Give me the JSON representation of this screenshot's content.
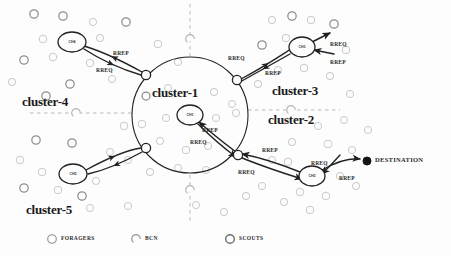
{
  "figure": {
    "title_text_visible": false,
    "background_color": "#fdfdfd",
    "ink_color": "#222222",
    "node_gray": "#8e8e8e",
    "node_light_gray": "#c9c9c9"
  },
  "cluster_labels": [
    {
      "id": "cluster-1",
      "text": "cluster-1",
      "x": 152,
      "y": 86
    },
    {
      "id": "cluster-2",
      "text": "cluster-2",
      "x": 268,
      "y": 113
    },
    {
      "id": "cluster-3",
      "text": "cluster-3",
      "x": 272,
      "y": 84
    },
    {
      "id": "cluster-4",
      "text": "cluster-4",
      "x": 22,
      "y": 95
    },
    {
      "id": "cluster-5",
      "text": "cluster-5",
      "x": 26,
      "y": 203
    }
  ],
  "cluster_heads": [
    {
      "id": "ch4",
      "label": "CH4",
      "cx": 72,
      "cy": 42,
      "rx": 14,
      "ry": 10
    },
    {
      "id": "ch3",
      "label": "CH3",
      "cx": 302,
      "cy": 47,
      "rx": 13,
      "ry": 10
    },
    {
      "id": "ch1",
      "label": "CH1",
      "cx": 190,
      "cy": 115,
      "rx": 13,
      "ry": 10
    },
    {
      "id": "ch5",
      "label": "CH5",
      "cx": 73,
      "cy": 174,
      "rx": 14,
      "ry": 10
    },
    {
      "id": "ch2",
      "label": "CH2",
      "cx": 312,
      "cy": 176,
      "rx": 13,
      "ry": 10
    }
  ],
  "gateway_nodes": [
    {
      "id": "gw-northwest",
      "cx": 146,
      "cy": 75
    },
    {
      "id": "gw-northeast",
      "cx": 237,
      "cy": 80
    },
    {
      "id": "gw-southeast",
      "cx": 238,
      "cy": 155
    },
    {
      "id": "gw-southwest",
      "cx": 146,
      "cy": 148
    }
  ],
  "destination": {
    "id": "destination",
    "label": "DESTINATION",
    "cx": 367,
    "cy": 161,
    "r": 4,
    "label_x": 375,
    "label_y": 157
  },
  "packet_labels": [
    {
      "id": "p1",
      "text": "RREP",
      "x": 113,
      "y": 51
    },
    {
      "id": "p2",
      "text": "RREQ",
      "x": 96,
      "y": 68
    },
    {
      "id": "p3",
      "text": "RREQ",
      "x": 228,
      "y": 56
    },
    {
      "id": "p4",
      "text": "RREP",
      "x": 265,
      "y": 71
    },
    {
      "id": "p5",
      "text": "RREQ",
      "x": 330,
      "y": 42
    },
    {
      "id": "p6",
      "text": "RREP",
      "x": 330,
      "y": 60
    },
    {
      "id": "p7",
      "text": "RREP",
      "x": 202,
      "y": 128
    },
    {
      "id": "p8",
      "text": "RREQ",
      "x": 190,
      "y": 140
    },
    {
      "id": "p9",
      "text": "RREP",
      "x": 262,
      "y": 148
    },
    {
      "id": "p10",
      "text": "RREQ",
      "x": 238,
      "y": 170
    },
    {
      "id": "p11",
      "text": "RREQ",
      "x": 311,
      "y": 161
    },
    {
      "id": "p12",
      "text": "RREP",
      "x": 339,
      "y": 176
    }
  ],
  "legend": {
    "items": [
      {
        "id": "legend-foragers",
        "text": "FORAGERS",
        "marker": "open-circle",
        "cx": 52,
        "cy": 239,
        "text_x": 61,
        "text_y": 236
      },
      {
        "id": "legend-bcn",
        "text": "BCN",
        "marker": "dashed-circle",
        "cx": 136,
        "cy": 239,
        "text_x": 145,
        "text_y": 236
      },
      {
        "id": "legend-scouts",
        "text": "SCOUTS",
        "marker": "bold-circle",
        "cx": 230,
        "cy": 239,
        "text_x": 239,
        "text_y": 236
      }
    ]
  },
  "big_circle": {
    "cx": 190,
    "cy": 115,
    "r": 58
  },
  "divider_lines": [
    {
      "id": "divider-top",
      "x1": 190,
      "y1": 4,
      "x2": 190,
      "y2": 56
    },
    {
      "id": "divider-bottom",
      "x1": 190,
      "y1": 175,
      "x2": 190,
      "y2": 222
    },
    {
      "id": "divider-left",
      "x1": 30,
      "y1": 113,
      "x2": 132,
      "y2": 113
    },
    {
      "id": "divider-right",
      "x1": 248,
      "y1": 110,
      "x2": 340,
      "y2": 110
    }
  ],
  "bcn_on_dividers": [
    {
      "id": "bcn-top",
      "cx": 190,
      "cy": 39
    },
    {
      "id": "bcn-bottom",
      "cx": 190,
      "cy": 190
    },
    {
      "id": "bcn-left",
      "cx": 76,
      "cy": 113
    },
    {
      "id": "bcn-right",
      "cx": 291,
      "cy": 110
    }
  ],
  "scatter_nodes": [
    {
      "cx": 34,
      "cy": 14,
      "r": 4.2,
      "tone": "mid"
    },
    {
      "cx": 63,
      "cy": 16,
      "r": 4.2,
      "tone": "mid"
    },
    {
      "cx": 93,
      "cy": 22,
      "r": 3.6,
      "tone": "light"
    },
    {
      "cx": 126,
      "cy": 22,
      "r": 4.2,
      "tone": "mid"
    },
    {
      "cx": 43,
      "cy": 39,
      "r": 3.8,
      "tone": "light"
    },
    {
      "cx": 100,
      "cy": 38,
      "r": 3.6,
      "tone": "light"
    },
    {
      "cx": 24,
      "cy": 60,
      "r": 4.2,
      "tone": "mid"
    },
    {
      "cx": 53,
      "cy": 57,
      "r": 3.8,
      "tone": "light"
    },
    {
      "cx": 90,
      "cy": 63,
      "r": 3.8,
      "tone": "light"
    },
    {
      "cx": 70,
      "cy": 84,
      "r": 4.2,
      "tone": "mid"
    },
    {
      "cx": 46,
      "cy": 96,
      "r": 4.2,
      "tone": "mid"
    },
    {
      "cx": 112,
      "cy": 79,
      "r": 3.6,
      "tone": "light"
    },
    {
      "cx": 12,
      "cy": 82,
      "r": 3.6,
      "tone": "light"
    },
    {
      "cx": 36,
      "cy": 140,
      "r": 4.2,
      "tone": "mid"
    },
    {
      "cx": 72,
      "cy": 143,
      "r": 4.2,
      "tone": "mid"
    },
    {
      "cx": 20,
      "cy": 160,
      "r": 3.8,
      "tone": "light"
    },
    {
      "cx": 42,
      "cy": 172,
      "r": 3.8,
      "tone": "light"
    },
    {
      "cx": 24,
      "cy": 188,
      "r": 4.2,
      "tone": "mid"
    },
    {
      "cx": 58,
      "cy": 190,
      "r": 3.8,
      "tone": "light"
    },
    {
      "cx": 82,
      "cy": 196,
      "r": 4.2,
      "tone": "mid"
    },
    {
      "cx": 96,
      "cy": 181,
      "r": 3.6,
      "tone": "light"
    },
    {
      "cx": 110,
      "cy": 152,
      "r": 3.6,
      "tone": "light"
    },
    {
      "cx": 128,
      "cy": 160,
      "r": 3.6,
      "tone": "light"
    },
    {
      "cx": 90,
      "cy": 208,
      "r": 3.6,
      "tone": "light"
    },
    {
      "cx": 158,
      "cy": 44,
      "r": 3.8,
      "tone": "light"
    },
    {
      "cx": 178,
      "cy": 62,
      "r": 3.6,
      "tone": "light"
    },
    {
      "cx": 146,
      "cy": 96,
      "r": 4.0,
      "tone": "mid"
    },
    {
      "cx": 168,
      "cy": 88,
      "r": 3.6,
      "tone": "light"
    },
    {
      "cx": 214,
      "cy": 92,
      "r": 3.6,
      "tone": "light"
    },
    {
      "cx": 232,
      "cy": 104,
      "r": 3.6,
      "tone": "light"
    },
    {
      "cx": 142,
      "cy": 124,
      "r": 3.8,
      "tone": "light"
    },
    {
      "cx": 166,
      "cy": 118,
      "r": 3.6,
      "tone": "light"
    },
    {
      "cx": 216,
      "cy": 118,
      "r": 3.6,
      "tone": "light"
    },
    {
      "cx": 236,
      "cy": 113,
      "r": 3.6,
      "tone": "light"
    },
    {
      "cx": 160,
      "cy": 141,
      "r": 3.6,
      "tone": "light"
    },
    {
      "cx": 186,
      "cy": 150,
      "r": 3.8,
      "tone": "light"
    },
    {
      "cx": 208,
      "cy": 146,
      "r": 3.6,
      "tone": "light"
    },
    {
      "cx": 178,
      "cy": 168,
      "r": 3.6,
      "tone": "light"
    },
    {
      "cx": 206,
      "cy": 170,
      "r": 3.6,
      "tone": "light"
    },
    {
      "cx": 150,
      "cy": 172,
      "r": 3.6,
      "tone": "light"
    },
    {
      "cx": 272,
      "cy": 20,
      "r": 3.6,
      "tone": "light"
    },
    {
      "cx": 292,
      "cy": 16,
      "r": 4.2,
      "tone": "mid"
    },
    {
      "cx": 311,
      "cy": 20,
      "r": 3.8,
      "tone": "light"
    },
    {
      "cx": 334,
      "cy": 24,
      "r": 4.2,
      "tone": "mid"
    },
    {
      "cx": 286,
      "cy": 38,
      "r": 3.8,
      "tone": "light"
    },
    {
      "cx": 262,
      "cy": 45,
      "r": 4.2,
      "tone": "mid"
    },
    {
      "cx": 346,
      "cy": 50,
      "r": 3.8,
      "tone": "light"
    },
    {
      "cx": 304,
      "cy": 68,
      "r": 3.8,
      "tone": "light"
    },
    {
      "cx": 278,
      "cy": 70,
      "r": 3.6,
      "tone": "light"
    },
    {
      "cx": 330,
      "cy": 76,
      "r": 3.6,
      "tone": "light"
    },
    {
      "cx": 258,
      "cy": 84,
      "r": 3.6,
      "tone": "light"
    },
    {
      "cx": 350,
      "cy": 94,
      "r": 3.6,
      "tone": "light"
    },
    {
      "cx": 318,
      "cy": 126,
      "r": 3.6,
      "tone": "light"
    },
    {
      "cx": 344,
      "cy": 120,
      "r": 3.6,
      "tone": "light"
    },
    {
      "cx": 292,
      "cy": 142,
      "r": 3.6,
      "tone": "light"
    },
    {
      "cx": 328,
      "cy": 144,
      "r": 3.8,
      "tone": "light"
    },
    {
      "cx": 352,
      "cy": 150,
      "r": 3.6,
      "tone": "light"
    },
    {
      "cx": 288,
      "cy": 162,
      "r": 3.8,
      "tone": "light"
    },
    {
      "cx": 300,
      "cy": 192,
      "r": 3.8,
      "tone": "light"
    },
    {
      "cx": 326,
      "cy": 196,
      "r": 3.8,
      "tone": "light"
    },
    {
      "cx": 284,
      "cy": 202,
      "r": 3.6,
      "tone": "light"
    },
    {
      "cx": 340,
      "cy": 176,
      "r": 3.6,
      "tone": "light"
    },
    {
      "cx": 262,
      "cy": 186,
      "r": 3.6,
      "tone": "light"
    },
    {
      "cx": 356,
      "cy": 186,
      "r": 3.6,
      "tone": "light"
    },
    {
      "cx": 310,
      "cy": 210,
      "r": 3.8,
      "tone": "light"
    },
    {
      "cx": 272,
      "cy": 160,
      "r": 3.6,
      "tone": "light"
    },
    {
      "cx": 246,
      "cy": 196,
      "r": 3.6,
      "tone": "light"
    },
    {
      "cx": 368,
      "cy": 130,
      "r": 3.6,
      "tone": "light"
    },
    {
      "cx": 224,
      "cy": 212,
      "r": 3.6,
      "tone": "light"
    },
    {
      "cx": 196,
      "cy": 205,
      "r": 3.6,
      "tone": "light"
    },
    {
      "cx": 128,
      "cy": 206,
      "r": 3.6,
      "tone": "light"
    },
    {
      "cx": 124,
      "cy": 126,
      "r": 3.8,
      "tone": "light"
    }
  ],
  "edges": [
    {
      "id": "edge-ch4-to-gw-rreq",
      "d": "M 84 49 C 104 62 124 70 141 75",
      "arrow_at": "mid"
    },
    {
      "id": "edge-gw-to-ch4-rrep",
      "d": "M 142 72 C 124 62 104 52 84 46",
      "arrow_at": "mid"
    },
    {
      "id": "edge-gw-to-ch3-rreq",
      "d": "M 241 79 C 262 68 280 56 291 49",
      "arrow_at": "mid"
    },
    {
      "id": "edge-ch3-to-gw-rrep",
      "d": "M 290 54 C 272 64 254 74 240 82",
      "arrow_at": "mid"
    },
    {
      "id": "edge-ch3-out-rreq",
      "d": "M 312 42 L 330 33",
      "arrow_at": "end"
    },
    {
      "id": "edge-ch3-in-rrep",
      "d": "M 334 54 L 314 50",
      "arrow_at": "end"
    },
    {
      "id": "edge-gwse-to-ch1-rrep",
      "d": "M 236 152 C 220 140 208 130 199 122",
      "arrow_at": "end"
    },
    {
      "id": "edge-ch1-to-gwse-rreq",
      "d": "M 198 124 C 210 136 224 148 236 157",
      "arrow_at": "end"
    },
    {
      "id": "edge-ch2-to-gwse-rrep",
      "d": "M 300 172 C 280 164 258 157 242 154",
      "arrow_at": "end"
    },
    {
      "id": "edge-gwse-to-ch2-rreq",
      "d": "M 242 158 C 262 166 286 174 302 179",
      "arrow_at": "end"
    },
    {
      "id": "edge-ch2-to-dest-rreq",
      "d": "M 322 170 C 336 162 350 158 360 159",
      "arrow_at": "end"
    },
    {
      "id": "edge-dest-to-ch2-rrep",
      "d": "M 340 155 C 332 164 326 170 322 174",
      "arrow_at": "end"
    },
    {
      "id": "edge-ch5-to-gwsw",
      "d": "M 86 170 C 108 158 128 150 141 148",
      "arrow_at": "mid"
    },
    {
      "id": "edge-gwsw-to-ch5",
      "d": "M 142 152 C 124 162 106 170 88 174",
      "arrow_at": "mid"
    }
  ]
}
